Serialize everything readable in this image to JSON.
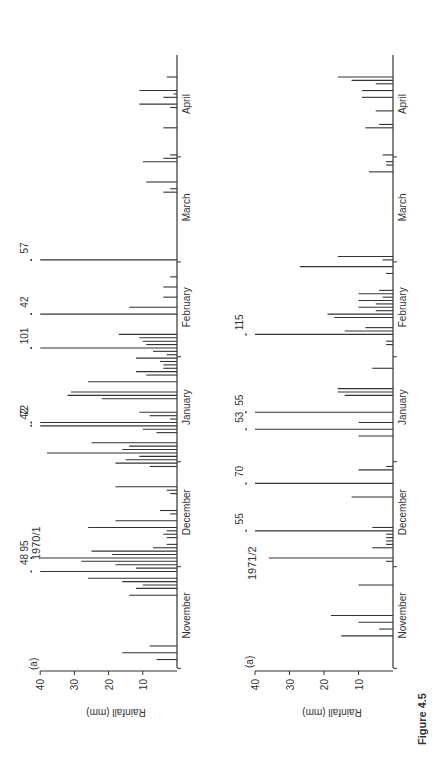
{
  "figure": {
    "caption": "Figure 4.5",
    "orientation": "rotated 90 degrees counter-clockwise"
  },
  "chart_data": [
    {
      "type": "bar",
      "title": "1970/1",
      "panel_label": "(a)",
      "xlabel": "",
      "ylabel": "Rainfall (mm)",
      "ylim": [
        0,
        40
      ],
      "yticks": [
        10,
        20,
        30,
        40
      ],
      "month_labels": [
        "November",
        "December",
        "January",
        "February",
        "March",
        "April"
      ],
      "x_unit": "day index from 1 November (0-181)",
      "grid": false,
      "overflow_annotations": [
        {
          "day": 28,
          "value": 48
        },
        {
          "day": 32,
          "value": 95
        },
        {
          "day": 71,
          "value": 42
        },
        {
          "day": 72,
          "value": 72
        },
        {
          "day": 94,
          "value": 101
        },
        {
          "day": 104,
          "value": 42
        },
        {
          "day": 120,
          "value": 57
        }
      ],
      "bars": [
        {
          "day": 2,
          "value": 6
        },
        {
          "day": 4,
          "value": 16
        },
        {
          "day": 6,
          "value": 8
        },
        {
          "day": 21,
          "value": 14
        },
        {
          "day": 23,
          "value": 12
        },
        {
          "day": 24,
          "value": 10
        },
        {
          "day": 25,
          "value": 16
        },
        {
          "day": 26,
          "value": 26
        },
        {
          "day": 28,
          "value": 40
        },
        {
          "day": 29,
          "value": 12
        },
        {
          "day": 30,
          "value": 18
        },
        {
          "day": 31,
          "value": 28
        },
        {
          "day": 32,
          "value": 40
        },
        {
          "day": 33,
          "value": 19
        },
        {
          "day": 34,
          "value": 25
        },
        {
          "day": 35,
          "value": 7
        },
        {
          "day": 36,
          "value": 3
        },
        {
          "day": 38,
          "value": 3
        },
        {
          "day": 39,
          "value": 4
        },
        {
          "day": 40,
          "value": 3
        },
        {
          "day": 41,
          "value": 26
        },
        {
          "day": 43,
          "value": 18
        },
        {
          "day": 45,
          "value": 2
        },
        {
          "day": 46,
          "value": 5
        },
        {
          "day": 51,
          "value": 2
        },
        {
          "day": 52,
          "value": 3
        },
        {
          "day": 53,
          "value": 18
        },
        {
          "day": 59,
          "value": 8
        },
        {
          "day": 60,
          "value": 18
        },
        {
          "day": 61,
          "value": 15
        },
        {
          "day": 62,
          "value": 11
        },
        {
          "day": 63,
          "value": 38
        },
        {
          "day": 64,
          "value": 16
        },
        {
          "day": 65,
          "value": 14
        },
        {
          "day": 66,
          "value": 25
        },
        {
          "day": 69,
          "value": 6
        },
        {
          "day": 70,
          "value": 10
        },
        {
          "day": 71,
          "value": 40
        },
        {
          "day": 72,
          "value": 40
        },
        {
          "day": 73,
          "value": 2
        },
        {
          "day": 74,
          "value": 8
        },
        {
          "day": 75,
          "value": 11
        },
        {
          "day": 79,
          "value": 22
        },
        {
          "day": 80,
          "value": 32
        },
        {
          "day": 81,
          "value": 31
        },
        {
          "day": 84,
          "value": 26
        },
        {
          "day": 86,
          "value": 9
        },
        {
          "day": 87,
          "value": 12
        },
        {
          "day": 88,
          "value": 4
        },
        {
          "day": 89,
          "value": 4
        },
        {
          "day": 90,
          "value": 5
        },
        {
          "day": 91,
          "value": 12
        },
        {
          "day": 92,
          "value": 3
        },
        {
          "day": 93,
          "value": 7
        },
        {
          "day": 94,
          "value": 40
        },
        {
          "day": 95,
          "value": 9
        },
        {
          "day": 96,
          "value": 10
        },
        {
          "day": 97,
          "value": 11
        },
        {
          "day": 98,
          "value": 17
        },
        {
          "day": 104,
          "value": 40
        },
        {
          "day": 106,
          "value": 14
        },
        {
          "day": 109,
          "value": 4
        },
        {
          "day": 112,
          "value": 4
        },
        {
          "day": 115,
          "value": 2
        },
        {
          "day": 120,
          "value": 40
        },
        {
          "day": 140,
          "value": 4
        },
        {
          "day": 141,
          "value": 2
        },
        {
          "day": 143,
          "value": 9
        },
        {
          "day": 149,
          "value": 10
        },
        {
          "day": 150,
          "value": 4
        },
        {
          "day": 151,
          "value": 2
        },
        {
          "day": 159,
          "value": 4
        },
        {
          "day": 165,
          "value": 2
        },
        {
          "day": 166,
          "value": 11
        },
        {
          "day": 168,
          "value": 4
        },
        {
          "day": 169,
          "value": 1
        },
        {
          "day": 170,
          "value": 11
        },
        {
          "day": 174,
          "value": 3
        }
      ]
    },
    {
      "type": "bar",
      "title": "1971/2",
      "panel_label": "(a)",
      "xlabel": "",
      "ylabel": "Rainfall (mm)",
      "ylim": [
        0,
        40
      ],
      "yticks": [
        10,
        20,
        30,
        40
      ],
      "month_labels": [
        "November",
        "December",
        "January",
        "February",
        "March",
        "April"
      ],
      "x_unit": "day index from 1 November (0-181)",
      "grid": false,
      "overflow_annotations": [
        {
          "day": 40,
          "value": 55
        },
        {
          "day": 54,
          "value": 70
        },
        {
          "day": 70,
          "value": 53
        },
        {
          "day": 75,
          "value": 55
        },
        {
          "day": 98,
          "value": 115
        }
      ],
      "bars": [
        {
          "day": 9,
          "value": 15
        },
        {
          "day": 11,
          "value": 4
        },
        {
          "day": 13,
          "value": 10
        },
        {
          "day": 15,
          "value": 18
        },
        {
          "day": 24,
          "value": 10
        },
        {
          "day": 31,
          "value": 2
        },
        {
          "day": 32,
          "value": 36
        },
        {
          "day": 35,
          "value": 6
        },
        {
          "day": 36,
          "value": 2
        },
        {
          "day": 37,
          "value": 2
        },
        {
          "day": 38,
          "value": 2
        },
        {
          "day": 39,
          "value": 2
        },
        {
          "day": 40,
          "value": 40
        },
        {
          "day": 41,
          "value": 6
        },
        {
          "day": 50,
          "value": 12
        },
        {
          "day": 54,
          "value": 40
        },
        {
          "day": 58,
          "value": 10
        },
        {
          "day": 59,
          "value": 2
        },
        {
          "day": 68,
          "value": 10
        },
        {
          "day": 70,
          "value": 40
        },
        {
          "day": 72,
          "value": 10
        },
        {
          "day": 75,
          "value": 40
        },
        {
          "day": 80,
          "value": 14
        },
        {
          "day": 81,
          "value": 16
        },
        {
          "day": 82,
          "value": 16
        },
        {
          "day": 88,
          "value": 6
        },
        {
          "day": 95,
          "value": 2
        },
        {
          "day": 96,
          "value": 2
        },
        {
          "day": 98,
          "value": 40
        },
        {
          "day": 99,
          "value": 14
        },
        {
          "day": 100,
          "value": 8
        },
        {
          "day": 103,
          "value": 17
        },
        {
          "day": 104,
          "value": 19
        },
        {
          "day": 105,
          "value": 5
        },
        {
          "day": 106,
          "value": 10
        },
        {
          "day": 107,
          "value": 5
        },
        {
          "day": 108,
          "value": 10
        },
        {
          "day": 109,
          "value": 3
        },
        {
          "day": 110,
          "value": 10
        },
        {
          "day": 111,
          "value": 4
        },
        {
          "day": 116,
          "value": 2
        },
        {
          "day": 118,
          "value": 27
        },
        {
          "day": 120,
          "value": 3
        },
        {
          "day": 121,
          "value": 16
        },
        {
          "day": 146,
          "value": 7
        },
        {
          "day": 148,
          "value": 2
        },
        {
          "day": 149,
          "value": 2
        },
        {
          "day": 151,
          "value": 3
        },
        {
          "day": 159,
          "value": 8
        },
        {
          "day": 160,
          "value": 4
        },
        {
          "day": 164,
          "value": 5
        },
        {
          "day": 168,
          "value": 9
        },
        {
          "day": 170,
          "value": 9
        },
        {
          "day": 172,
          "value": 5
        },
        {
          "day": 173,
          "value": 12
        },
        {
          "day": 174,
          "value": 16
        }
      ]
    }
  ]
}
